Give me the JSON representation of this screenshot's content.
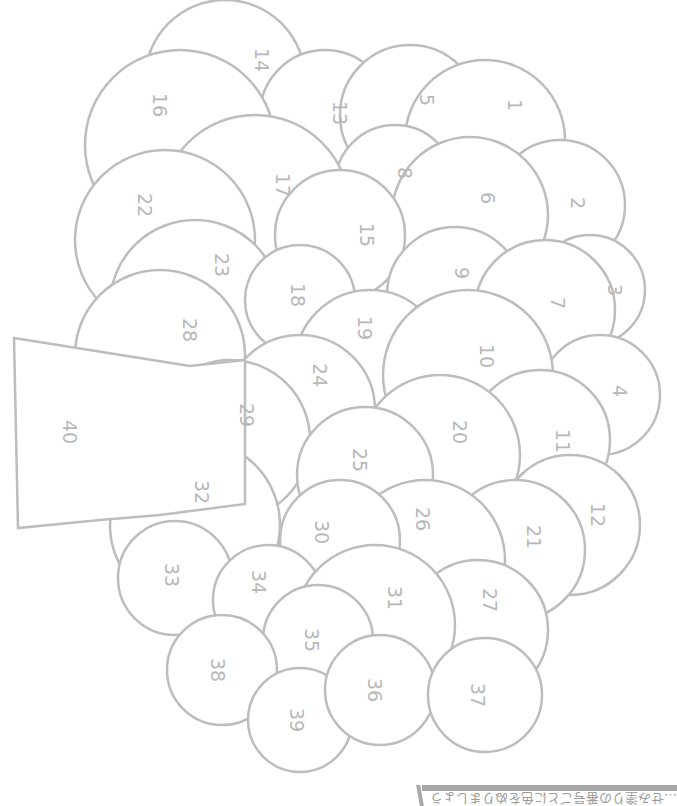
{
  "diagram": {
    "type": "color-by-number",
    "stroke_color": "#bdbdbd",
    "label_color": "#b8b8b8",
    "label_rotation_deg": 90,
    "neck": {
      "label": "40",
      "points": "14,338 190,366 245,360 245,504 160,515 100,520 18,528",
      "label_pos": [
        70,
        432
      ]
    },
    "circles": [
      {
        "label": "14",
        "cx": 225,
        "cy": 80,
        "r": 80,
        "lx": 262,
        "ly": 60
      },
      {
        "label": "13",
        "cx": 325,
        "cy": 115,
        "r": 65,
        "lx": 340,
        "ly": 113
      },
      {
        "label": "5",
        "cx": 410,
        "cy": 115,
        "r": 70,
        "lx": 427,
        "ly": 100
      },
      {
        "label": "1",
        "cx": 485,
        "cy": 140,
        "r": 80,
        "lx": 515,
        "ly": 105
      },
      {
        "label": "16",
        "cx": 180,
        "cy": 145,
        "r": 95,
        "lx": 160,
        "ly": 105
      },
      {
        "label": "8",
        "cx": 395,
        "cy": 185,
        "r": 60,
        "lx": 405,
        "ly": 173
      },
      {
        "label": "2",
        "cx": 560,
        "cy": 205,
        "r": 65,
        "lx": 578,
        "ly": 203
      },
      {
        "label": "6",
        "cx": 470,
        "cy": 215,
        "r": 78,
        "lx": 488,
        "ly": 198
      },
      {
        "label": "17",
        "cx": 255,
        "cy": 210,
        "r": 95,
        "lx": 283,
        "ly": 185
      },
      {
        "label": "15",
        "cx": 340,
        "cy": 235,
        "r": 65,
        "lx": 367,
        "ly": 235
      },
      {
        "label": "3",
        "cx": 590,
        "cy": 290,
        "r": 55,
        "lx": 615,
        "ly": 290
      },
      {
        "label": "22",
        "cx": 165,
        "cy": 240,
        "r": 90,
        "lx": 145,
        "ly": 205
      },
      {
        "label": "9",
        "cx": 455,
        "cy": 295,
        "r": 68,
        "lx": 462,
        "ly": 273
      },
      {
        "label": "7",
        "cx": 545,
        "cy": 310,
        "r": 70,
        "lx": 558,
        "ly": 303
      },
      {
        "label": "23",
        "cx": 195,
        "cy": 305,
        "r": 85,
        "lx": 222,
        "ly": 265
      },
      {
        "label": "18",
        "cx": 300,
        "cy": 300,
        "r": 55,
        "lx": 298,
        "ly": 295
      },
      {
        "label": "28",
        "cx": 160,
        "cy": 355,
        "r": 85,
        "lx": 190,
        "ly": 330
      },
      {
        "label": "4",
        "cx": 600,
        "cy": 395,
        "r": 60,
        "lx": 620,
        "ly": 391
      },
      {
        "label": "19",
        "cx": 370,
        "cy": 365,
        "r": 75,
        "lx": 365,
        "ly": 328
      },
      {
        "label": "10",
        "cx": 468,
        "cy": 375,
        "r": 85,
        "lx": 487,
        "ly": 356
      },
      {
        "label": "11",
        "cx": 540,
        "cy": 440,
        "r": 70,
        "lx": 563,
        "ly": 441
      },
      {
        "label": "24",
        "cx": 300,
        "cy": 410,
        "r": 75,
        "lx": 320,
        "ly": 375
      },
      {
        "label": "29",
        "cx": 230,
        "cy": 440,
        "r": 80,
        "lx": 247,
        "ly": 415
      },
      {
        "label": "20",
        "cx": 440,
        "cy": 455,
        "r": 80,
        "lx": 460,
        "ly": 432
      },
      {
        "label": "12",
        "cx": 570,
        "cy": 525,
        "r": 70,
        "lx": 598,
        "ly": 515
      },
      {
        "label": "25",
        "cx": 365,
        "cy": 475,
        "r": 68,
        "lx": 360,
        "ly": 460
      },
      {
        "label": "32",
        "cx": 195,
        "cy": 525,
        "r": 85,
        "lx": 202,
        "ly": 492
      },
      {
        "label": "21",
        "cx": 515,
        "cy": 550,
        "r": 70,
        "lx": 534,
        "ly": 537
      },
      {
        "label": "26",
        "cx": 425,
        "cy": 560,
        "r": 80,
        "lx": 423,
        "ly": 519
      },
      {
        "label": "30",
        "cx": 340,
        "cy": 540,
        "r": 60,
        "lx": 322,
        "ly": 532
      },
      {
        "label": "33",
        "cx": 175,
        "cy": 578,
        "r": 57,
        "lx": 172,
        "ly": 575
      },
      {
        "label": "34",
        "cx": 268,
        "cy": 600,
        "r": 55,
        "lx": 259,
        "ly": 582
      },
      {
        "label": "27",
        "cx": 478,
        "cy": 630,
        "r": 70,
        "lx": 490,
        "ly": 600
      },
      {
        "label": "31",
        "cx": 375,
        "cy": 625,
        "r": 80,
        "lx": 395,
        "ly": 598
      },
      {
        "label": "35",
        "cx": 318,
        "cy": 640,
        "r": 55,
        "lx": 312,
        "ly": 640
      },
      {
        "label": "38",
        "cx": 222,
        "cy": 670,
        "r": 55,
        "lx": 218,
        "ly": 670
      },
      {
        "label": "39",
        "cx": 300,
        "cy": 720,
        "r": 52,
        "lx": 297,
        "ly": 720
      },
      {
        "label": "36",
        "cx": 380,
        "cy": 690,
        "r": 55,
        "lx": 375,
        "ly": 690
      },
      {
        "label": "37",
        "cx": 485,
        "cy": 695,
        "r": 57,
        "lx": 478,
        "ly": 695
      }
    ]
  },
  "footer": {
    "bar_color": "#a8a8a8",
    "text": "…せみ塗りの番号ごとに色をぬりましょう"
  }
}
